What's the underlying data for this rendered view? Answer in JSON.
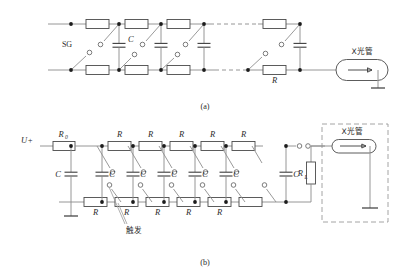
{
  "figure": {
    "panels": [
      {
        "id": "a",
        "caption": "(a)",
        "labels": {
          "spark_gap": "SG",
          "capacitor": "C",
          "resistor": "R",
          "tube": "X光管"
        },
        "stage_count": 4,
        "top_resistor_labels": [
          "",
          "",
          "",
          ""
        ],
        "bottom_resistor_labels": [
          "",
          "",
          "",
          "R"
        ],
        "capacitor_labels": [
          "C",
          "",
          "",
          ""
        ]
      },
      {
        "id": "b",
        "caption": "(b)",
        "labels": {
          "input_voltage": "U+",
          "charge_resistor": "R",
          "charge_resistor_sub": "0",
          "resistor": "R",
          "capacitor": "C",
          "load_resistor": "R",
          "load_resistor_sub": "L",
          "trigger": "触发",
          "tube": "X光管"
        },
        "stage_count": 6,
        "top_resistor_labels": [
          "R",
          "R",
          "R",
          "R",
          "R"
        ],
        "bottom_resistor_labels": [
          "R",
          "R",
          "R",
          "R",
          "R"
        ],
        "capacitor_labels": [
          "C",
          "C",
          "C",
          "C",
          "C",
          "C"
        ]
      }
    ],
    "colors": {
      "wire": "#8a8a8a",
      "component_outline": "#4a4a4a",
      "node": "#1c1c1c",
      "text": "#2b2b2b",
      "enclosure": "#9a9a9a",
      "background": "#ffffff"
    }
  }
}
